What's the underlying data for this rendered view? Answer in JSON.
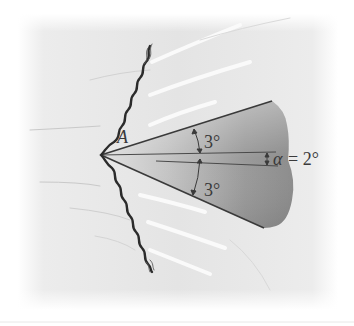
{
  "figure": {
    "type": "oblique-shock-wedge-diagram",
    "labels": {
      "point": "A",
      "upper_half_angle": "3°",
      "lower_half_angle": "3°",
      "alpha_symbol": "α",
      "alpha_equals": "= 2°"
    },
    "values": {
      "half_angle_deg": 3,
      "angle_of_attack_deg": 2
    },
    "colors": {
      "background": "#f0f0f0",
      "panel": "#e6e6e6",
      "wedge_dark": "#8a8a8a",
      "wedge_light": "#d9d9d9",
      "lines": "#3c3c3c",
      "shock": "#2e2e2e",
      "text": "#3a3a3a"
    }
  }
}
